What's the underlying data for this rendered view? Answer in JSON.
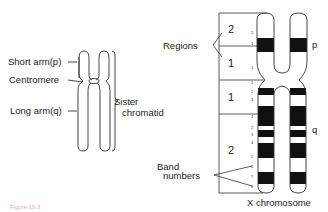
{
  "left_diagram": {
    "labels": {
      "short_arm": "Short arm(p)",
      "centromere": "Centromere",
      "long_arm": "Long arm(q)",
      "sister_chromatid_line1": "Sister",
      "sister_chromatid_line2": "chromatid"
    }
  },
  "right_diagram": {
    "regions_label": "Regions",
    "band_numbers_label_line1": "Band",
    "band_numbers_label_line2": "numbers",
    "arm_p": "p",
    "arm_q": "q",
    "chromosome_title": "X chromosome",
    "regions": [
      {
        "arm": "p",
        "region": "2",
        "bands": [
          "2",
          "1"
        ]
      },
      {
        "arm": "p",
        "region": "1",
        "bands": [
          "1"
        ]
      },
      {
        "arm": "q",
        "region": "1",
        "bands": [
          "1",
          "2",
          "3"
        ]
      },
      {
        "arm": "q",
        "region": "2",
        "bands": [
          "1",
          "2",
          "3",
          "4",
          "5",
          "6",
          "7",
          "8"
        ]
      }
    ]
  },
  "caption": "Figure 10.3",
  "colors": {
    "ink": "#222222",
    "band_dark": "#111111",
    "caption": "#d04a4a"
  }
}
